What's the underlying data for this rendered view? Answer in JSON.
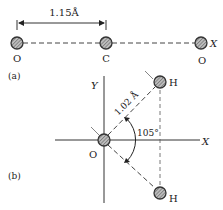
{
  "part_a": {
    "label": "(a)",
    "bond_length": "1.15Å",
    "atoms": [
      {
        "symbol": "O"
      },
      {
        "symbol": "C"
      },
      {
        "symbol": "O"
      }
    ],
    "axis_label": "X"
  },
  "part_b": {
    "label": "(b)",
    "bond_length": "1.02 Å",
    "angle": "105°",
    "atoms": [
      {
        "symbol": "O"
      },
      {
        "symbol": "H"
      },
      {
        "symbol": "H"
      }
    ],
    "axis_x": "X",
    "axis_y": "Y"
  },
  "colors": {
    "atom_fill": "#9a9a9a",
    "line": "#333333"
  }
}
